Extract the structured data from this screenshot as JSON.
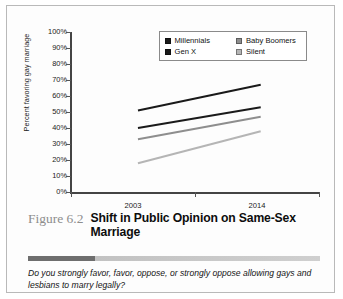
{
  "figure": {
    "number": "Figure 6.2",
    "title": "Shift in Public Opinion on Same-Sex Marriage",
    "subtitle": "Do you strongly favor, favor, oppose, or strongly oppose allowing gays and lesbians to marry legally?"
  },
  "legend": {
    "entries": [
      {
        "label": "Millennials",
        "color": "#1a1a1a",
        "swatch": "legend-swatch-millennials"
      },
      {
        "label": "Baby Boomers",
        "color": "#8e8e8e",
        "swatch": "legend-swatch-baby-boomers"
      },
      {
        "label": "Gen X",
        "color": "#1a1a1a",
        "swatch": "legend-swatch-gen-x"
      },
      {
        "label": "Silent",
        "color": "#b5b5b5",
        "swatch": "legend-swatch-silent"
      }
    ]
  },
  "chart_data": {
    "type": "line",
    "title": "Shift in Public Opinion on Same-Sex Marriage",
    "xlabel": "",
    "ylabel": "Percent favoring gay marriage",
    "x": [
      "2003",
      "2014"
    ],
    "categories": [
      "2003",
      "2014"
    ],
    "ylim": [
      0,
      100
    ],
    "yticks": [
      0,
      10,
      20,
      30,
      40,
      50,
      60,
      70,
      80,
      90,
      100
    ],
    "ytick_labels": [
      "0%",
      "10%",
      "20%",
      "30%",
      "40%",
      "50%",
      "60%",
      "70%",
      "80%",
      "90%",
      "100%"
    ],
    "xtick_labels": [
      "2003",
      "2014"
    ],
    "grid": false,
    "legend_position": "top-right",
    "series": [
      {
        "name": "Millennials",
        "values": [
          51,
          67
        ],
        "color": "#1a1a1a"
      },
      {
        "name": "Gen X",
        "values": [
          40,
          53
        ],
        "color": "#1a1a1a"
      },
      {
        "name": "Baby Boomers",
        "values": [
          33,
          47
        ],
        "color": "#8e8e8e"
      },
      {
        "name": "Silent",
        "values": [
          18,
          38
        ],
        "color": "#b5b5b5"
      }
    ]
  }
}
